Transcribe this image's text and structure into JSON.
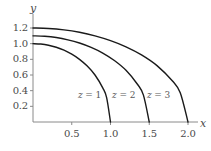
{
  "chart_data": {
    "type": "line",
    "title": "",
    "xlabel": "x",
    "ylabel": "y",
    "xlim": [
      0,
      2.15
    ],
    "ylim": [
      0,
      1.3
    ],
    "grid": false,
    "legend_position": "inline-annotations",
    "xticks": [
      "0.5",
      "1.0",
      "1.5",
      "2.0"
    ],
    "xtick_values": [
      0.5,
      1.0,
      1.5,
      2.0
    ],
    "yticks": [
      "0.2",
      "0.4",
      "0.6",
      "0.8",
      "1.0",
      "1.2"
    ],
    "ytick_values": [
      0.2,
      0.4,
      0.6,
      0.8,
      1.0,
      1.2
    ],
    "series": [
      {
        "name": "z = 1",
        "label_var": "z",
        "label_eq": "=",
        "label_value": "1",
        "y_intercept": 1.0,
        "x_intercept": 1.0,
        "color": "#1a1a1a",
        "points": [
          [
            0.0,
            1.0
          ],
          [
            0.1,
            0.995
          ],
          [
            0.2,
            0.98
          ],
          [
            0.3,
            0.954
          ],
          [
            0.4,
            0.917
          ],
          [
            0.5,
            0.866
          ],
          [
            0.6,
            0.8
          ],
          [
            0.7,
            0.714
          ],
          [
            0.8,
            0.6
          ],
          [
            0.9,
            0.436
          ],
          [
            0.95,
            0.312
          ],
          [
            1.0,
            0.0
          ]
        ]
      },
      {
        "name": "z = 2",
        "label_var": "z",
        "label_eq": "=",
        "label_value": "2",
        "y_intercept": 1.1,
        "x_intercept": 1.5,
        "color": "#1a1a1a",
        "points": [
          [
            0.0,
            1.1
          ],
          [
            0.15,
            1.094
          ],
          [
            0.3,
            1.078
          ],
          [
            0.45,
            1.049
          ],
          [
            0.6,
            1.008
          ],
          [
            0.75,
            0.952
          ],
          [
            0.9,
            0.88
          ],
          [
            1.05,
            0.785
          ],
          [
            1.2,
            0.66
          ],
          [
            1.35,
            0.479
          ],
          [
            1.425,
            0.343
          ],
          [
            1.5,
            0.0
          ]
        ]
      },
      {
        "name": "z = 3",
        "label_var": "z",
        "label_eq": "=",
        "label_value": "3",
        "y_intercept": 1.2,
        "x_intercept": 2.0,
        "color": "#1a1a1a",
        "points": [
          [
            0.0,
            1.2
          ],
          [
            0.2,
            1.194
          ],
          [
            0.4,
            1.176
          ],
          [
            0.6,
            1.145
          ],
          [
            0.8,
            1.1
          ],
          [
            1.0,
            1.039
          ],
          [
            1.2,
            0.96
          ],
          [
            1.4,
            0.857
          ],
          [
            1.6,
            0.72
          ],
          [
            1.8,
            0.523
          ],
          [
            1.9,
            0.374
          ],
          [
            2.0,
            0.0
          ]
        ]
      }
    ],
    "annotations": [
      {
        "text": "z = 1",
        "x": 0.58,
        "y": 0.33
      },
      {
        "text": "z = 2",
        "x": 1.02,
        "y": 0.33
      },
      {
        "text": "z = 3",
        "x": 1.47,
        "y": 0.33
      }
    ]
  },
  "axes": {
    "y_name": "y",
    "x_name": "x",
    "axis_color": "#808080",
    "tick_color": "#808080",
    "label_color": "#4a4a4a"
  }
}
